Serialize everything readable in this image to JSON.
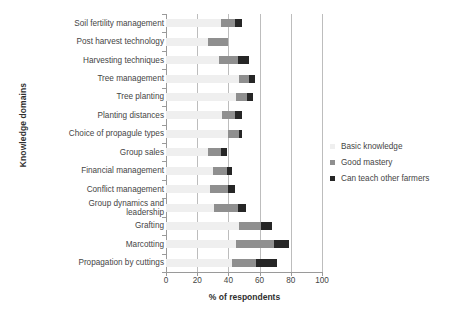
{
  "chart_data": {
    "type": "bar",
    "orientation": "horizontal",
    "stacked": true,
    "title": "",
    "xlabel": "% of respondents",
    "ylabel": "Knowledge domains",
    "xlim": [
      0,
      100
    ],
    "xticks": [
      0,
      20,
      40,
      60,
      80,
      100
    ],
    "grid": "vertical",
    "legend_position": "right",
    "categories": [
      "Soil fertility management",
      "Post harvest technology",
      "Harvesting techniques",
      "Tree management",
      "Tree planting",
      "Planting distances",
      "Choice of propagule types",
      "Group sales",
      "Financial management",
      "Conflict management",
      "Group dynamics and\nleadership",
      "Grafting",
      "Marcotting",
      "Propagation by cuttings"
    ],
    "series": [
      {
        "name": "Basic knowledge",
        "color": "#efefef",
        "values": [
          35,
          27,
          34,
          47,
          45,
          36,
          40,
          27,
          30,
          28,
          31,
          47,
          45,
          42
        ]
      },
      {
        "name": "Good mastery",
        "color": "#8f8f8f",
        "values": [
          9,
          13,
          12,
          6,
          7,
          8,
          7,
          8,
          9,
          12,
          15,
          14,
          24,
          16
        ]
      },
      {
        "name": "Can  teach other farmers",
        "color": "#262626",
        "values": [
          5,
          0,
          7,
          4,
          4,
          5,
          2,
          4,
          3,
          4,
          5,
          7,
          10,
          13
        ]
      }
    ],
    "totals": [
      49,
      40,
      53,
      57,
      56,
      49,
      49,
      39,
      42,
      44,
      51,
      68,
      79,
      71
    ]
  },
  "legend": {
    "items": [
      {
        "label": "Basic knowledge",
        "color": "#efefef"
      },
      {
        "label": "Good mastery",
        "color": "#8f8f8f"
      },
      {
        "label": "Can  teach other farmers",
        "color": "#262626"
      }
    ]
  },
  "axes": {
    "x_title": "% of respondents",
    "y_title": "Knowledge domains",
    "x_tick_labels": [
      "0",
      "20",
      "40",
      "60",
      "80",
      "100"
    ]
  }
}
